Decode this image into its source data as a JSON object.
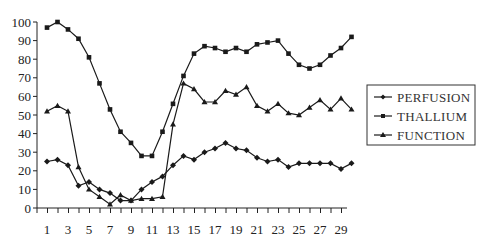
{
  "chart_data": {
    "type": "line",
    "title": "",
    "xlabel": "",
    "ylabel": "",
    "x": [
      1,
      2,
      3,
      4,
      5,
      6,
      7,
      8,
      9,
      10,
      11,
      12,
      13,
      14,
      15,
      16,
      17,
      18,
      19,
      20,
      21,
      22,
      23,
      24,
      25,
      26,
      27,
      28,
      29,
      30
    ],
    "x_tick_labels": [
      "1",
      "3",
      "5",
      "7",
      "9",
      "11",
      "13",
      "15",
      "17",
      "19",
      "21",
      "23",
      "25",
      "27",
      "29"
    ],
    "y_tick_labels": [
      "0",
      "10",
      "20",
      "30",
      "40",
      "50",
      "60",
      "70",
      "80",
      "90",
      "100"
    ],
    "ylim": [
      0,
      100
    ],
    "xlim": [
      1,
      30
    ],
    "grid": false,
    "legend_position": "right",
    "series": [
      {
        "name": "PERFUSION",
        "marker": "diamond",
        "values": [
          25,
          26,
          23,
          12,
          14,
          10,
          8,
          4,
          4,
          10,
          14,
          17,
          23,
          28,
          26,
          30,
          32,
          35,
          32,
          31,
          27,
          25,
          26,
          22,
          24,
          24,
          24,
          24,
          21,
          24
        ]
      },
      {
        "name": "THALLIUM",
        "marker": "square",
        "values": [
          97,
          100,
          96,
          91,
          81,
          67,
          53,
          41,
          35,
          28,
          28,
          41,
          56,
          71,
          83,
          87,
          86,
          84,
          86,
          84,
          88,
          89,
          90,
          83,
          77,
          75,
          77,
          82,
          86,
          92
        ]
      },
      {
        "name": "FUNCTION",
        "marker": "triangle",
        "values": [
          52,
          55,
          52,
          22,
          10,
          6,
          2,
          7,
          4,
          5,
          5,
          6,
          45,
          67,
          64,
          57,
          57,
          63,
          61,
          65,
          55,
          52,
          56,
          51,
          50,
          54,
          58,
          53,
          59,
          53
        ]
      }
    ]
  },
  "legend": {
    "items": [
      {
        "label": "PERFUSION",
        "marker": "diamond"
      },
      {
        "label": "THALLIUM",
        "marker": "square"
      },
      {
        "label": "FUNCTION",
        "marker": "triangle"
      }
    ]
  },
  "colors": {
    "line": "#1a1a1a",
    "axis": "#222222",
    "background": "#ffffff"
  }
}
